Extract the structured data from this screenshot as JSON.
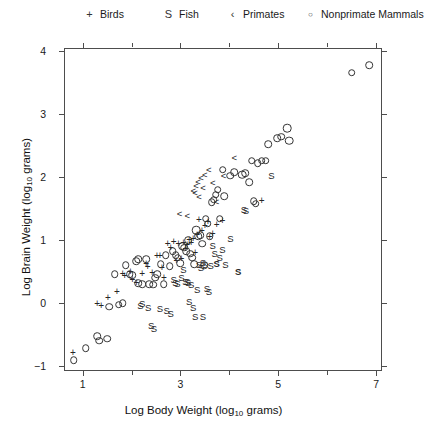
{
  "chart_data": {
    "type": "scatter",
    "title": "",
    "xlabel": "Log Body Weight (log10 grams)",
    "ylabel": "Log Brain Weight (log10 grams)",
    "xlabel_prefix": "Log Body Weight (log",
    "xlabel_sub": "10",
    "xlabel_suffix": " grams)",
    "ylabel_prefix": "Log Brain Weight (log",
    "ylabel_sub": "10",
    "ylabel_suffix": " grams)",
    "xlim": [
      0.62,
      7.12
    ],
    "ylim": [
      -1.08,
      4.05
    ],
    "xticks": [
      1,
      3,
      5,
      7
    ],
    "xticks_minor": [
      2,
      4,
      6
    ],
    "yticks": [
      -1,
      0,
      1,
      2,
      3,
      4
    ],
    "grid": false,
    "legend_position": "top",
    "series": [
      {
        "name": "Birds",
        "symbol": "+",
        "marker": "plus",
        "points": [
          [
            0.8,
            -0.79
          ],
          [
            1.3,
            -0.02
          ],
          [
            1.38,
            -0.05
          ],
          [
            1.52,
            0.08
          ],
          [
            1.7,
            0.17
          ],
          [
            1.82,
            0.46
          ],
          [
            1.86,
            0.43
          ],
          [
            1.98,
            0.5
          ],
          [
            2.02,
            0.36
          ],
          [
            2.1,
            0.31
          ],
          [
            2.22,
            0.46
          ],
          [
            2.3,
            0.62
          ],
          [
            2.33,
            0.57
          ],
          [
            2.42,
            0.48
          ],
          [
            2.52,
            0.74
          ],
          [
            2.58,
            0.74
          ],
          [
            2.62,
            0.55
          ],
          [
            2.66,
            0.4
          ],
          [
            2.74,
            0.93
          ],
          [
            2.8,
            0.88
          ],
          [
            2.86,
            0.97
          ],
          [
            2.92,
            0.66
          ],
          [
            2.96,
            0.94
          ],
          [
            3.02,
            0.7
          ],
          [
            3.06,
            0.96
          ],
          [
            3.1,
            0.86
          ],
          [
            3.14,
            0.92
          ],
          [
            3.18,
            1.0
          ],
          [
            3.22,
            0.95
          ],
          [
            3.26,
            1.02
          ],
          [
            3.3,
            0.79
          ],
          [
            3.34,
            1.08
          ],
          [
            3.38,
            1.32
          ],
          [
            3.44,
            1.14
          ],
          [
            3.5,
            1.22
          ],
          [
            3.56,
            1.28
          ],
          [
            3.6,
            1.05
          ],
          [
            3.66,
            1.1
          ],
          [
            3.74,
            1.24
          ],
          [
            3.86,
            1.3
          ],
          [
            4.66,
            1.62
          ]
        ]
      },
      {
        "name": "Fish",
        "symbol": "S",
        "marker": "letter-S",
        "points": [
          [
            2.18,
            -0.05
          ],
          [
            2.22,
            -0.02
          ],
          [
            2.34,
            -0.08
          ],
          [
            2.4,
            -0.36
          ],
          [
            2.46,
            -0.42
          ],
          [
            2.58,
            -0.1
          ],
          [
            2.72,
            -0.12
          ],
          [
            2.8,
            -0.18
          ],
          [
            2.86,
            0.36
          ],
          [
            2.9,
            0.32
          ],
          [
            2.94,
            0.3
          ],
          [
            3.02,
            0.4
          ],
          [
            3.06,
            0.53
          ],
          [
            3.1,
            0.34
          ],
          [
            3.14,
            0.33
          ],
          [
            3.16,
            0.31
          ],
          [
            3.22,
            0.29
          ],
          [
            3.26,
            -0.08
          ],
          [
            3.3,
            -0.22
          ],
          [
            3.34,
            0.2
          ],
          [
            3.38,
            0.6
          ],
          [
            3.42,
            0.55
          ],
          [
            3.46,
            0.63
          ],
          [
            3.5,
            0.6
          ],
          [
            3.54,
            0.22
          ],
          [
            3.58,
            0.18
          ],
          [
            3.62,
            0.58
          ],
          [
            3.66,
            0.9
          ],
          [
            3.7,
            0.78
          ],
          [
            3.74,
            0.62
          ],
          [
            3.8,
            0.72
          ],
          [
            3.86,
            0.84
          ],
          [
            3.92,
            0.6
          ],
          [
            4.02,
            1.02
          ],
          [
            4.18,
            0.5
          ],
          [
            4.3,
            1.48
          ],
          [
            4.34,
            1.46
          ],
          [
            4.86,
            2.02
          ],
          [
            3.46,
            -0.22
          ],
          [
            3.18,
            0.02
          ]
        ]
      },
      {
        "name": "Primates",
        "symbol": "<",
        "marker": "less-than",
        "points": [
          [
            2.98,
            1.42
          ],
          [
            3.14,
            1.38
          ],
          [
            3.26,
            1.78
          ],
          [
            3.3,
            1.74
          ],
          [
            3.32,
            1.86
          ],
          [
            3.36,
            1.92
          ],
          [
            3.38,
            1.68
          ],
          [
            3.42,
            1.98
          ],
          [
            3.46,
            1.82
          ],
          [
            3.5,
            2.04
          ],
          [
            3.58,
            2.12
          ],
          [
            3.66,
            1.9
          ],
          [
            3.74,
            1.6
          ],
          [
            3.88,
            2.02
          ],
          [
            4.1,
            2.3
          ]
        ]
      },
      {
        "name": "Nonprimate Mammals",
        "symbol": "o",
        "marker": "open-circle",
        "points": [
          [
            0.82,
            -0.91
          ],
          [
            1.06,
            -0.72
          ],
          [
            1.3,
            -0.53
          ],
          [
            1.34,
            -0.6
          ],
          [
            1.5,
            -0.57
          ],
          [
            1.54,
            -0.06
          ],
          [
            1.74,
            -0.03
          ],
          [
            1.82,
            0.0
          ],
          [
            1.88,
            0.6
          ],
          [
            1.96,
            0.46
          ],
          [
            2.02,
            0.44
          ],
          [
            2.1,
            0.66
          ],
          [
            2.14,
            0.31
          ],
          [
            2.22,
            0.3
          ],
          [
            2.3,
            0.7
          ],
          [
            2.36,
            0.3
          ],
          [
            2.44,
            0.29
          ],
          [
            2.48,
            0.4
          ],
          [
            2.52,
            0.46
          ],
          [
            2.6,
            0.62
          ],
          [
            2.66,
            0.3
          ],
          [
            2.7,
            0.76
          ],
          [
            2.78,
            0.58
          ],
          [
            2.84,
            0.82
          ],
          [
            2.9,
            0.76
          ],
          [
            2.94,
            0.72
          ],
          [
            3.0,
            0.63
          ],
          [
            3.04,
            0.9
          ],
          [
            3.08,
            0.88
          ],
          [
            3.12,
            0.82
          ],
          [
            3.16,
            1.0
          ],
          [
            3.2,
            0.78
          ],
          [
            3.24,
            0.72
          ],
          [
            3.28,
            0.62
          ],
          [
            3.32,
            1.16
          ],
          [
            3.36,
            1.06
          ],
          [
            3.4,
            1.08
          ],
          [
            3.44,
            0.94
          ],
          [
            3.48,
            0.6
          ],
          [
            3.52,
            1.34
          ],
          [
            3.56,
            1.26
          ],
          [
            3.6,
            1.06
          ],
          [
            3.64,
            1.6
          ],
          [
            3.68,
            1.64
          ],
          [
            3.72,
            1.72
          ],
          [
            3.76,
            1.8
          ],
          [
            3.8,
            1.34
          ],
          [
            3.9,
            1.7
          ],
          [
            4.02,
            2.02
          ],
          [
            4.1,
            2.08
          ],
          [
            4.26,
            2.04
          ],
          [
            4.32,
            2.06
          ],
          [
            4.4,
            1.92
          ],
          [
            4.46,
            2.26
          ],
          [
            4.58,
            2.22
          ],
          [
            4.66,
            2.26
          ],
          [
            4.74,
            2.26
          ],
          [
            4.5,
            1.62
          ],
          [
            4.54,
            1.58
          ],
          [
            4.8,
            2.52
          ],
          [
            4.98,
            2.62
          ],
          [
            5.06,
            2.64
          ],
          [
            5.18,
            2.78
          ],
          [
            5.22,
            2.58
          ],
          [
            6.5,
            3.66
          ],
          [
            6.86,
            3.78
          ],
          [
            3.86,
            2.12
          ],
          [
            2.14,
            0.7
          ],
          [
            1.66,
            0.46
          ]
        ]
      }
    ]
  },
  "legend": {
    "items": [
      {
        "symbol": "+",
        "label": "Birds",
        "x": 84
      },
      {
        "symbol": "S",
        "label": "Fish",
        "x": 163
      },
      {
        "symbol": "‹",
        "label": "Primates",
        "x": 227
      },
      {
        "symbol": "○",
        "label": "Nonprimate Mammals",
        "x": 305
      }
    ]
  },
  "axes": {
    "x_ticks": [
      "1",
      "3",
      "5",
      "7"
    ],
    "y_ticks": [
      "4",
      "3",
      "2",
      "1",
      "0",
      "−1"
    ]
  }
}
